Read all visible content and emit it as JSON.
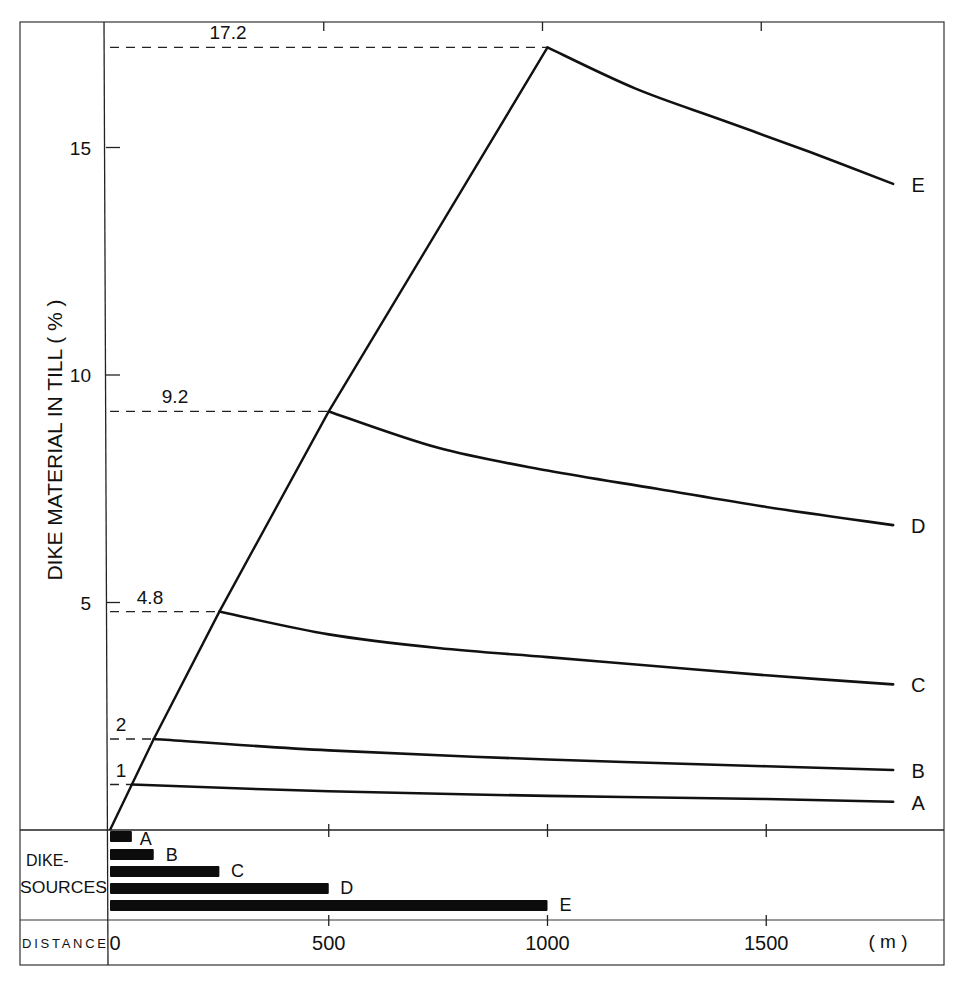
{
  "chart_data": {
    "type": "line",
    "title": "",
    "ylabel": "DIKE MATERIAL IN TILL ( % )",
    "xlabel": "DISTANCE",
    "x_unit": "( m )",
    "xlim": [
      0,
      1800
    ],
    "ylim": [
      0,
      17.5
    ],
    "x_ticks": [
      0,
      500,
      1000,
      1500
    ],
    "y_ticks": [
      5,
      10,
      15
    ],
    "grid": false,
    "legend_position": "curve-end labels",
    "rise_line": {
      "name": "maximum concentration envelope",
      "x": [
        0,
        50,
        100,
        250,
        500,
        1000
      ],
      "y": [
        0,
        1,
        2,
        4.8,
        9.2,
        17.2
      ]
    },
    "peak_annotations": [
      {
        "label": "1",
        "value": 1
      },
      {
        "label": "2",
        "value": 2
      },
      {
        "label": "4.8",
        "value": 4.8
      },
      {
        "label": "9.2",
        "value": 9.2
      },
      {
        "label": "17.2",
        "value": 17.2
      }
    ],
    "series": [
      {
        "name": "A",
        "x": [
          50,
          500,
          1000,
          1500,
          1790
        ],
        "y": [
          1.0,
          0.85,
          0.75,
          0.68,
          0.62
        ]
      },
      {
        "name": "B",
        "x": [
          100,
          500,
          1000,
          1500,
          1790
        ],
        "y": [
          2.0,
          1.75,
          1.55,
          1.4,
          1.32
        ]
      },
      {
        "name": "C",
        "x": [
          250,
          500,
          750,
          1000,
          1250,
          1500,
          1790
        ],
        "y": [
          4.8,
          4.3,
          4.0,
          3.8,
          3.6,
          3.4,
          3.2
        ]
      },
      {
        "name": "D",
        "x": [
          500,
          750,
          1000,
          1250,
          1500,
          1790
        ],
        "y": [
          9.2,
          8.4,
          7.9,
          7.5,
          7.1,
          6.7
        ]
      },
      {
        "name": "E",
        "x": [
          1000,
          1200,
          1400,
          1600,
          1790
        ],
        "y": [
          17.2,
          16.3,
          15.6,
          14.9,
          14.2
        ]
      }
    ],
    "dike_sources": {
      "label": "DIKE-SOURCES",
      "bars": [
        {
          "name": "A",
          "width_m": 50
        },
        {
          "name": "B",
          "width_m": 100
        },
        {
          "name": "C",
          "width_m": 250
        },
        {
          "name": "D",
          "width_m": 500
        },
        {
          "name": "E",
          "width_m": 1000
        }
      ]
    }
  }
}
